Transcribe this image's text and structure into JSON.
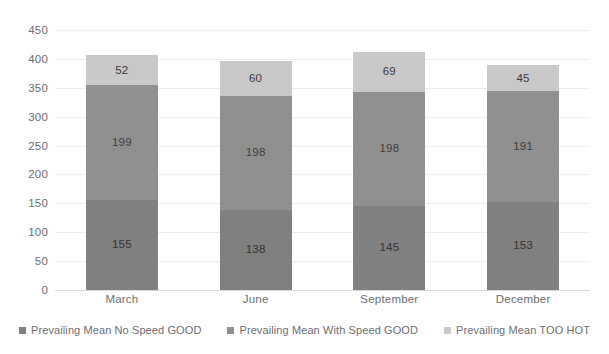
{
  "chart_data": {
    "type": "bar",
    "subtype": "stacked-column",
    "title": "",
    "xlabel": "",
    "ylabel": "",
    "categories": [
      "March",
      "June",
      "September",
      "December"
    ],
    "series": [
      {
        "name": "Prevailing Mean No Speed GOOD",
        "color": "#808080",
        "values": [
          155,
          138,
          145,
          153
        ]
      },
      {
        "name": "Prevailing Mean With Speed GOOD",
        "color": "#909090",
        "values": [
          199,
          198,
          198,
          191
        ]
      },
      {
        "name": "Prevailing Mean TOO HOT",
        "color": "#c9c9c9",
        "values": [
          52,
          60,
          69,
          45
        ]
      }
    ],
    "totals": [
      406,
      396,
      412,
      389
    ],
    "ylim": [
      0,
      450
    ],
    "ytick_step": 50,
    "yticks": [
      "450",
      "400",
      "350",
      "300",
      "250",
      "200",
      "150",
      "100",
      "50",
      "0"
    ],
    "ytick_values": [
      450,
      400,
      350,
      300,
      250,
      200,
      150,
      100,
      50,
      0
    ],
    "grid": true,
    "grid_axis": "y",
    "legend_position": "bottom",
    "background": "#ffffff",
    "gridline_color": "#eceded",
    "tick_label_color": "#6d6e71",
    "data_label_color": "#3f3f3f"
  },
  "legend": {
    "items": [
      {
        "label": "Prevailing Mean No Speed GOOD",
        "color": "#808080"
      },
      {
        "label": "Prevailing Mean With Speed GOOD",
        "color": "#909090"
      },
      {
        "label": "Prevailing Mean TOO HOT",
        "color": "#c9c9c9"
      }
    ]
  }
}
